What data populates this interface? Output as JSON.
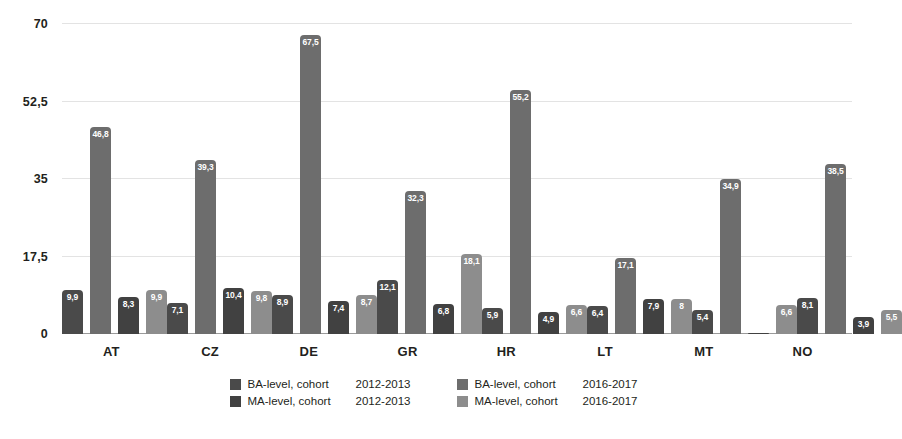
{
  "chart_data": {
    "type": "bar",
    "title": "",
    "subtitle": "",
    "xlabel": "",
    "ylabel": "",
    "ylim": [
      0,
      70
    ],
    "yticks": [
      "0",
      "17,5",
      "35",
      "52,5",
      "70"
    ],
    "ytick_values": [
      0,
      17.5,
      35,
      52.5,
      70
    ],
    "grid": true,
    "legend_position": "bottom",
    "decimal_separator": ",",
    "categories": [
      "AT",
      "CZ",
      "DE",
      "GR",
      "HR",
      "LT",
      "MT",
      "NO"
    ],
    "series": [
      {
        "name": "BA-level, cohort  2012-2013",
        "level": "BA-level, cohort",
        "cohort": "2012-2013",
        "color": "#4a4a4a",
        "values": [
          9.9,
          7.1,
          8.9,
          12.1,
          5.9,
          6.4,
          5.4,
          8.1
        ],
        "labels": [
          "9,9",
          "7,1",
          "8,9",
          "12,1",
          "5,9",
          "6,4",
          "5,4",
          "8,1"
        ]
      },
      {
        "name": "BA-level, cohort  2016-2017",
        "level": "BA-level, cohort",
        "cohort": "2016-2017",
        "color": "#6d6d6d",
        "values": [
          46.8,
          39.3,
          67.5,
          32.3,
          55.2,
          17.1,
          34.9,
          38.5
        ],
        "labels": [
          "46,8",
          "39,3",
          "67,5",
          "32,3",
          "55,2",
          "17,1",
          "34,9",
          "38,5"
        ]
      },
      {
        "name": "MA-level, cohort  2012-2013",
        "level": "MA-level, cohort",
        "cohort": "2012-2013",
        "color": "#414141",
        "values": [
          8.3,
          10.4,
          7.4,
          6.8,
          4.9,
          7.9,
          0.2,
          3.9
        ],
        "labels": [
          "8,3",
          "10,4",
          "7,4",
          "6,8",
          "4,9",
          "7,9",
          "",
          "3,9"
        ]
      },
      {
        "name": "MA-level, cohort  2016-2017",
        "level": "MA-level, cohort",
        "cohort": "2016-2017",
        "color": "#8d8d8d",
        "values": [
          9.9,
          9.8,
          8.7,
          18.1,
          6.6,
          8.0,
          6.6,
          5.5
        ],
        "labels": [
          "9,9",
          "9,8",
          "8,7",
          "18,1",
          "6,6",
          "8",
          "6,6",
          "5,5"
        ]
      }
    ]
  },
  "legend": {
    "columns": [
      [
        {
          "level": "BA-level, cohort",
          "cohort": "2012-2013",
          "color": "#4a4a4a"
        },
        {
          "level": "MA-level, cohort",
          "cohort": "2012-2013",
          "color": "#414141"
        }
      ],
      [
        {
          "level": "BA-level, cohort",
          "cohort": "2016-2017",
          "color": "#6d6d6d"
        },
        {
          "level": "MA-level, cohort",
          "cohort": "2016-2017",
          "color": "#8d8d8d"
        }
      ]
    ]
  },
  "colors": {
    "background": "#ffffff",
    "text": "#231f20",
    "gridline": "#e3e3e3",
    "axis": "#9a9a9a"
  }
}
